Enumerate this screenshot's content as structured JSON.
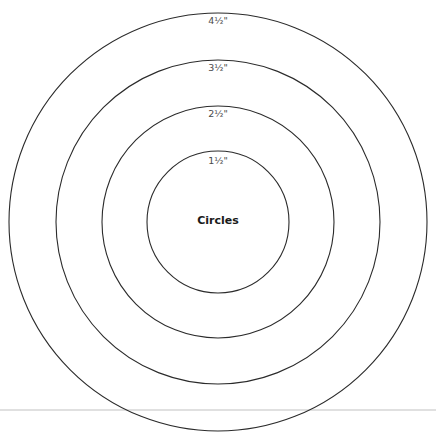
{
  "diagram": {
    "title": "Circles",
    "center": {
      "x": 218,
      "y": 222
    },
    "stroke_color": "#2b2b2b",
    "divider_color": "#d6d6d6",
    "divider_y": 410,
    "circles": [
      {
        "label": "1½\"",
        "radius": 71
      },
      {
        "label": "2½\"",
        "radius": 116
      },
      {
        "label": "3½\"",
        "radius": 162
      },
      {
        "label": "4½\"",
        "radius": 209
      }
    ]
  }
}
